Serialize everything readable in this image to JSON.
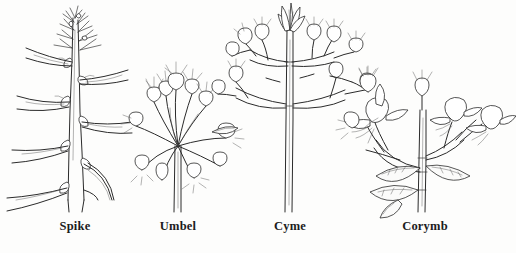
{
  "figure": {
    "background_color": "#fdfdfc",
    "ink_color": "#2b2b2b",
    "width": 516,
    "height": 253
  },
  "diagrams": [
    {
      "id": "spike",
      "label": "Spike",
      "label_x": 75,
      "label_y": 219,
      "description": "Unbranched elongate axis bearing sessile flowers attached directly to the stem, with long strap-shaped leaves"
    },
    {
      "id": "umbel",
      "label": "Umbel",
      "label_x": 178,
      "label_y": 219,
      "description": "Pedicels of nearly equal length radiating from a single common point at the stem apex, each tipped with a bud"
    },
    {
      "id": "cyme",
      "label": "Cyme",
      "label_x": 290,
      "label_y": 219,
      "description": "Determinate inflorescence with an open terminal flower at the apex and opposite lateral branches bearing buds"
    },
    {
      "id": "corymb",
      "label": "Corymb",
      "label_x": 425,
      "label_y": 219,
      "description": "Flat-topped cluster where lower pedicels are longer so all tubular flowers reach a common level, with broad ovate leaves"
    }
  ]
}
